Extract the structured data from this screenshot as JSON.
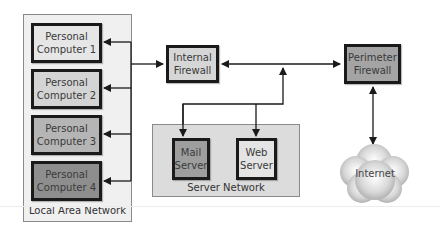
{
  "diagram": {
    "groups": {
      "lan": {
        "label": "Local Area Network",
        "color": "#f0f0f0"
      },
      "server_network": {
        "label": "Server Network",
        "color": "#dcdcdc"
      }
    },
    "nodes": {
      "pc1": {
        "label": "Personal\nComputer 1",
        "color": "#e6e6e6"
      },
      "pc2": {
        "label": "Personal\nComputer 2",
        "color": "#d4d4d4"
      },
      "pc3": {
        "label": "Personal\nComputer 3",
        "color": "#b5b5b5"
      },
      "pc4": {
        "label": "Personal\nComputer 4",
        "color": "#8e8e8e"
      },
      "internal_firewall": {
        "label": "Internal\nFirewall",
        "color": "#d6d6d6"
      },
      "perimeter_firewall": {
        "label": "Perimeter\nFirewall",
        "color": "#a4a4a4"
      },
      "mail_server": {
        "label": "Mail\nServer",
        "color": "#9e9e9e"
      },
      "web_server": {
        "label": "Web\nServer",
        "color": "#e4e4e4"
      },
      "internet": {
        "label": "Internet",
        "color": "#c8c8c8"
      }
    },
    "edges": [
      {
        "from": "internal_firewall",
        "to": "pc1",
        "type": "arrow"
      },
      {
        "from": "internal_firewall",
        "to": "pc2",
        "type": "arrow"
      },
      {
        "from": "internal_firewall",
        "to": "pc3",
        "type": "arrow"
      },
      {
        "from": "internal_firewall",
        "to": "pc4",
        "type": "arrow"
      },
      {
        "from": "lan_bus",
        "to": "internal_firewall",
        "type": "arrow"
      },
      {
        "from": "internal_firewall",
        "to": "perimeter_firewall",
        "type": "bidirectional"
      },
      {
        "from": "server_bus",
        "to": "firewall_link",
        "type": "arrow"
      },
      {
        "from": "server_bus",
        "to": "mail_server",
        "type": "arrow"
      },
      {
        "from": "server_bus",
        "to": "web_server",
        "type": "arrow"
      },
      {
        "from": "perimeter_firewall",
        "to": "internet",
        "type": "bidirectional"
      }
    ]
  }
}
